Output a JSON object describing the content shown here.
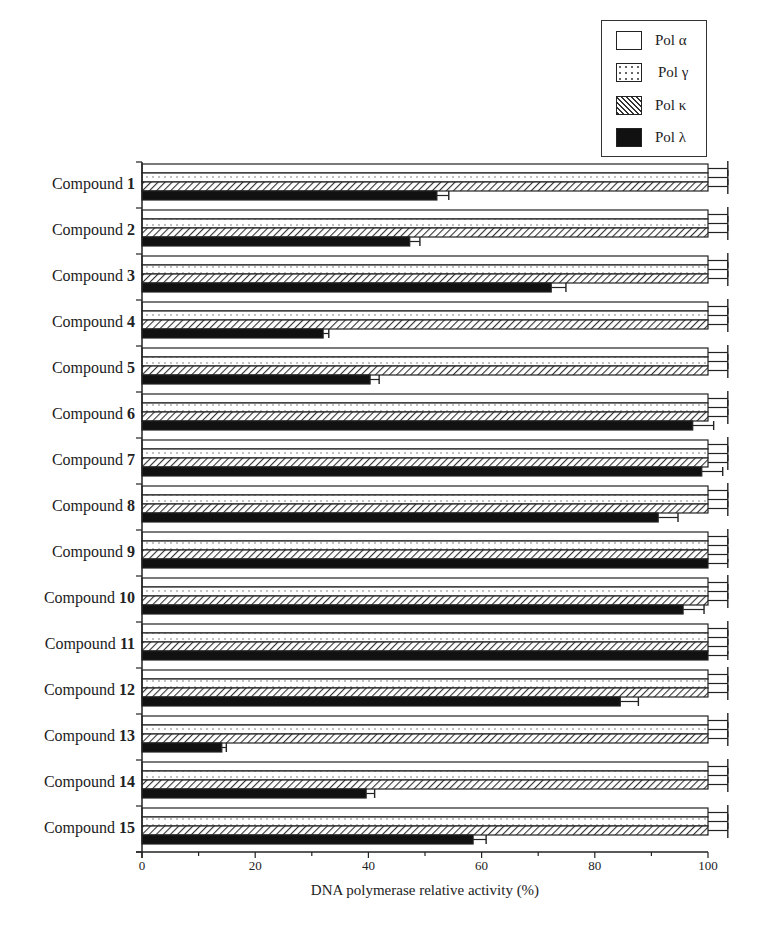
{
  "chart_data": {
    "type": "bar",
    "orientation": "horizontal",
    "title": "",
    "xlabel": "DNA polymerase relative activity  (%)",
    "ylabel": "",
    "xlim": [
      0,
      100
    ],
    "xticks": [
      "0",
      "20",
      "40",
      "60",
      "80",
      "100"
    ],
    "grid": false,
    "legend_position": "top-right",
    "categories": [
      "Compound 1",
      "Compound 2",
      "Compound 3",
      "Compound 4",
      "Compound 5",
      "Compound 6",
      "Compound 7",
      "Compound 8",
      "Compound 9",
      "Compound 10",
      "Compound 11",
      "Compound 12",
      "Compound 13",
      "Compound 14",
      "Compound 15"
    ],
    "series": [
      {
        "name": "Pol α",
        "pattern": "open",
        "values": [
          100,
          100,
          100,
          100,
          100,
          100,
          100,
          100,
          100,
          100,
          100,
          100,
          100,
          100,
          100
        ],
        "errors": [
          3.5,
          3.5,
          3.5,
          3.5,
          3.5,
          3.5,
          3.5,
          3.5,
          3.5,
          3.5,
          3.5,
          3.5,
          3.5,
          3.5,
          3.5
        ]
      },
      {
        "name": "Pol γ",
        "pattern": "dotted",
        "values": [
          100,
          100,
          100,
          100,
          100,
          100,
          100,
          100,
          100,
          100,
          100,
          100,
          100,
          100,
          100
        ],
        "errors": [
          3.5,
          3.5,
          3.5,
          3.5,
          3.5,
          3.5,
          3.5,
          3.5,
          3.5,
          3.5,
          3.5,
          3.5,
          3.5,
          3.5,
          3.5
        ]
      },
      {
        "name": "Pol κ",
        "pattern": "hatched",
        "values": [
          100,
          100,
          100,
          100,
          100,
          100,
          100,
          100,
          100,
          100,
          100,
          100,
          100,
          100,
          100
        ],
        "errors": [
          3.5,
          3.5,
          3.5,
          3.5,
          3.5,
          3.5,
          3.5,
          3.5,
          3.5,
          3.5,
          3.5,
          3.5,
          3.5,
          3.5,
          3.5
        ]
      },
      {
        "name": "Pol λ",
        "pattern": "solid-black",
        "values": [
          52.1,
          47.3,
          72.3,
          32.0,
          40.3,
          97.3,
          98.9,
          91.2,
          100,
          95.6,
          100,
          84.5,
          14.1,
          39.6,
          58.5
        ],
        "errors": [
          2.1,
          1.8,
          2.6,
          1.0,
          1.6,
          3.7,
          3.7,
          3.5,
          3.5,
          3.7,
          3.5,
          3.2,
          0.8,
          1.5,
          2.3
        ]
      }
    ]
  },
  "legend": {
    "items": [
      {
        "label": "Pol α"
      },
      {
        "label": "Pol γ"
      },
      {
        "label": "Pol κ"
      },
      {
        "label": "Pol λ"
      }
    ]
  },
  "yaxis": {
    "labels": [
      {
        "prefix": "Compound",
        "num": "1"
      },
      {
        "prefix": "Compound",
        "num": "2"
      },
      {
        "prefix": "Compound",
        "num": "3"
      },
      {
        "prefix": "Compound",
        "num": "4"
      },
      {
        "prefix": "Compound",
        "num": "5"
      },
      {
        "prefix": "Compound",
        "num": "6"
      },
      {
        "prefix": "Compound",
        "num": "7"
      },
      {
        "prefix": "Compound",
        "num": "8"
      },
      {
        "prefix": "Compound",
        "num": "9"
      },
      {
        "prefix": "Compound",
        "num": "10"
      },
      {
        "prefix": "Compound",
        "num": "11"
      },
      {
        "prefix": "Compound",
        "num": "12"
      },
      {
        "prefix": "Compound",
        "num": "13"
      },
      {
        "prefix": "Compound",
        "num": "14"
      },
      {
        "prefix": "Compound",
        "num": "15"
      }
    ]
  },
  "xaxis": {
    "ticks": [
      "0",
      "20",
      "40",
      "60",
      "80",
      "100"
    ],
    "title": "DNA polymerase relative activity  (%)"
  }
}
